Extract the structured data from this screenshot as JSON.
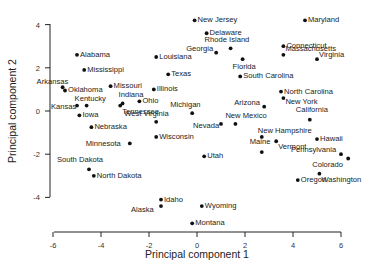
{
  "chart_data": {
    "type": "scatter",
    "title": "",
    "xlabel": "Principal component 1",
    "ylabel": "Principal component 2",
    "xlim": [
      -6,
      6
    ],
    "ylim": [
      -4,
      4
    ],
    "xticks": [
      -6,
      -4,
      -2,
      0,
      2,
      4,
      6
    ],
    "yticks": [
      -4,
      -2,
      0,
      2,
      4
    ],
    "grid": false,
    "legend": null,
    "points": [
      {
        "label": "Alabama",
        "x": -5.0,
        "y": 2.6
      },
      {
        "label": "Mississippi",
        "x": -4.7,
        "y": 1.9
      },
      {
        "label": "Arkansas",
        "x": -5.6,
        "y": 1.1
      },
      {
        "label": "Oklahoma",
        "x": -5.5,
        "y": 0.95
      },
      {
        "label": "Missouri",
        "x": -3.6,
        "y": 1.15
      },
      {
        "label": "Kentucky",
        "x": -4.6,
        "y": 0.25
      },
      {
        "label": "Kansas",
        "x": -5.0,
        "y": 0.25
      },
      {
        "label": "Iowa",
        "x": -4.9,
        "y": -0.2
      },
      {
        "label": "Nebraska",
        "x": -4.4,
        "y": -0.75
      },
      {
        "label": "Indiana",
        "x": -3.1,
        "y": 0.35
      },
      {
        "label": "Tennessee",
        "x": -3.2,
        "y": 0.25
      },
      {
        "label": "Ohio",
        "x": -2.4,
        "y": 0.45
      },
      {
        "label": "Illinois",
        "x": -1.8,
        "y": 1.0
      },
      {
        "label": "Louisiana",
        "x": -1.7,
        "y": 2.5
      },
      {
        "label": "Texas",
        "x": -1.2,
        "y": 1.7
      },
      {
        "label": "West Virginia",
        "x": -1.7,
        "y": -0.5
      },
      {
        "label": "Wisconsin",
        "x": -1.7,
        "y": -1.2
      },
      {
        "label": "Minnesota",
        "x": -2.8,
        "y": -1.5
      },
      {
        "label": "South Dakota",
        "x": -4.5,
        "y": -2.7
      },
      {
        "label": "North Dakota",
        "x": -4.3,
        "y": -3.0
      },
      {
        "label": "Idaho",
        "x": -1.5,
        "y": -4.1
      },
      {
        "label": "Alaska",
        "x": -1.5,
        "y": -4.4
      },
      {
        "label": "Wyoming",
        "x": 0.2,
        "y": -4.4
      },
      {
        "label": "Montana",
        "x": -0.2,
        "y": -5.2
      },
      {
        "label": "Utah",
        "x": 0.3,
        "y": -2.1
      },
      {
        "label": "Michigan",
        "x": -0.2,
        "y": -0.1
      },
      {
        "label": "Nevada",
        "x": 1.0,
        "y": -0.6
      },
      {
        "label": "New Mexico",
        "x": 1.6,
        "y": -0.6
      },
      {
        "label": "Arizona",
        "x": 2.8,
        "y": 0.2
      },
      {
        "label": "New Jersey",
        "x": -0.1,
        "y": 4.2
      },
      {
        "label": "Delaware",
        "x": 0.4,
        "y": 3.6
      },
      {
        "label": "Georgia",
        "x": 0.8,
        "y": 2.7
      },
      {
        "label": "Rhode Island",
        "x": 1.4,
        "y": 2.9
      },
      {
        "label": "Florida",
        "x": 1.9,
        "y": 2.4
      },
      {
        "label": "South Carolina",
        "x": 1.8,
        "y": 1.6
      },
      {
        "label": "Connecticut",
        "x": 3.6,
        "y": 3.0
      },
      {
        "label": "Massachusetts",
        "x": 3.6,
        "y": 2.6
      },
      {
        "label": "Virginia",
        "x": 5.0,
        "y": 2.4
      },
      {
        "label": "Maryland",
        "x": 4.5,
        "y": 4.2
      },
      {
        "label": "North Carolina",
        "x": 3.5,
        "y": 0.9
      },
      {
        "label": "New York",
        "x": 3.6,
        "y": 0.6
      },
      {
        "label": "California",
        "x": 4.7,
        "y": -0.4
      },
      {
        "label": "New Hampshire",
        "x": 2.7,
        "y": -1.2
      },
      {
        "label": "Vermont",
        "x": 3.3,
        "y": -1.4
      },
      {
        "label": "Hawaii",
        "x": 5.0,
        "y": -1.3
      },
      {
        "label": "Maine",
        "x": 2.7,
        "y": -1.9
      },
      {
        "label": "Pennsylvania",
        "x": 6.0,
        "y": -2.0
      },
      {
        "label": "Colorado",
        "x": 6.3,
        "y": -2.2
      },
      {
        "label": "Washington",
        "x": 5.1,
        "y": -2.9
      },
      {
        "label": "Oregon",
        "x": 4.2,
        "y": -3.2
      }
    ]
  },
  "caption": "...ing ... of the first two principal components ..."
}
